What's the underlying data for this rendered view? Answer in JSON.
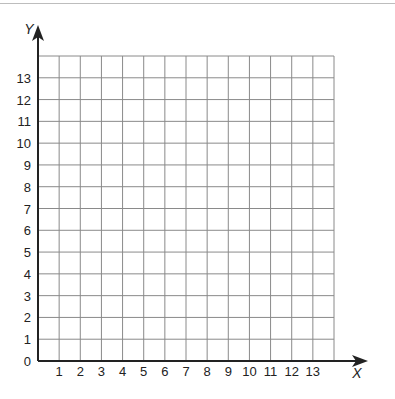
{
  "diagram": {
    "type": "coordinate-grid",
    "x_axis_label": "X",
    "y_axis_label": "Y",
    "x_ticks": [
      "1",
      "2",
      "3",
      "4",
      "5",
      "6",
      "7",
      "8",
      "9",
      "10",
      "11",
      "12",
      "13"
    ],
    "y_ticks": [
      "1",
      "2",
      "3",
      "4",
      "5",
      "6",
      "7",
      "8",
      "9",
      "10",
      "11",
      "12",
      "13"
    ],
    "origin_label": "0",
    "grid_columns": 14,
    "grid_rows": 14,
    "colors": {
      "grid": "#8a8a8a",
      "axis": "#222222",
      "background": "#ffffff"
    }
  }
}
